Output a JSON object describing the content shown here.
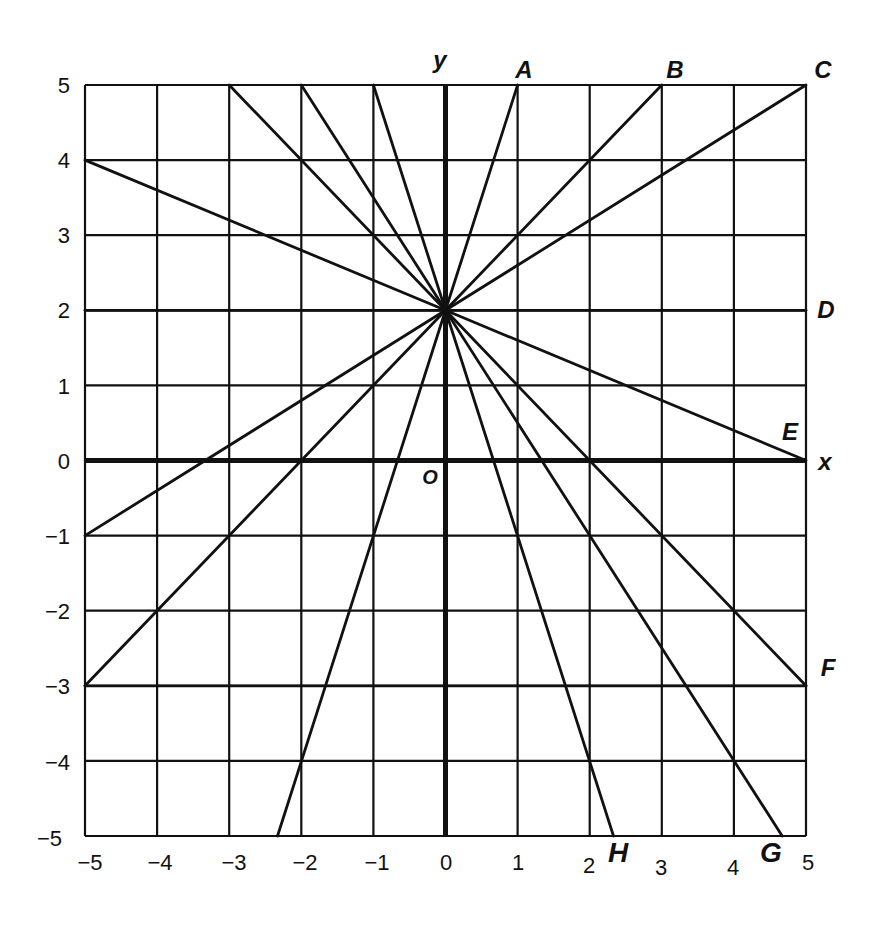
{
  "chart_data": {
    "type": "line",
    "title": "",
    "xlabel": "x",
    "ylabel": "y",
    "xlim": [
      -5,
      5
    ],
    "ylim": [
      -5,
      5
    ],
    "grid": true,
    "origin_label": "O",
    "x_ticks": [
      "−5",
      "−4",
      "−3",
      "−2",
      "−1",
      "0",
      "1",
      "2",
      "3",
      "4",
      "5"
    ],
    "y_ticks": [
      "5",
      "4",
      "3",
      "2",
      "1",
      "0",
      "−1",
      "−2",
      "−3",
      "−4",
      "−5"
    ],
    "pencil_center": [
      0,
      2
    ],
    "labeled_lines": [
      {
        "name": "A",
        "from": [
          0,
          2
        ],
        "to": [
          1,
          5
        ]
      },
      {
        "name": "B",
        "from": [
          0,
          2
        ],
        "to": [
          3,
          5
        ]
      },
      {
        "name": "C",
        "from": [
          0,
          2
        ],
        "to": [
          5,
          5
        ]
      },
      {
        "name": "D",
        "from": [
          -5,
          2
        ],
        "to": [
          5,
          2
        ]
      },
      {
        "name": "E",
        "from": [
          0,
          2
        ],
        "to": [
          5,
          0
        ]
      },
      {
        "name": "F",
        "from": [
          -5,
          -3
        ],
        "to": [
          5,
          -3
        ]
      },
      {
        "name": "G",
        "from": [
          0,
          2
        ],
        "to": [
          4.67,
          -5
        ]
      },
      {
        "name": "H",
        "from": [
          0,
          2
        ],
        "to": [
          2.33,
          -5
        ]
      }
    ],
    "unlabeled_lines": [
      {
        "from": [
          0,
          2
        ],
        "to": [
          -3,
          5
        ]
      },
      {
        "from": [
          0,
          2
        ],
        "to": [
          -2,
          5
        ]
      },
      {
        "from": [
          0,
          2
        ],
        "to": [
          -1,
          5
        ]
      },
      {
        "from": [
          0,
          2
        ],
        "to": [
          -5,
          4
        ]
      },
      {
        "from": [
          0,
          2
        ],
        "to": [
          -5,
          -1
        ]
      },
      {
        "from": [
          0,
          2
        ],
        "to": [
          -5,
          -3
        ]
      },
      {
        "from": [
          0,
          2
        ],
        "to": [
          -2.33,
          -5
        ]
      },
      {
        "from": [
          0,
          2
        ],
        "to": [
          5,
          -3
        ]
      }
    ]
  },
  "labels": {
    "y_axis": "y",
    "x_axis": "x",
    "origin": "O",
    "A": "A",
    "B": "B",
    "C": "C",
    "D": "D",
    "E": "E",
    "F": "F",
    "G": "G",
    "H": "H"
  },
  "ticks": {
    "x": [
      "−5",
      "−4",
      "−3",
      "−2",
      "−1",
      "0",
      "1",
      "2",
      "3",
      "4",
      "5"
    ],
    "y": [
      "5",
      "4",
      "3",
      "2",
      "1",
      "0",
      "−1",
      "−2",
      "−3",
      "−4",
      "−5"
    ]
  }
}
